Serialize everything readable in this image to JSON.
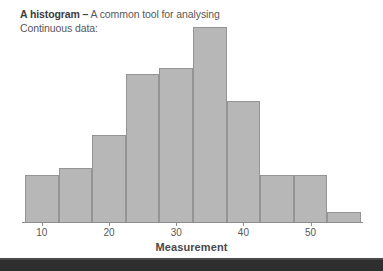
{
  "caption": {
    "lead": "A histogram –",
    "rest": " A common tool for analysing Continuous data:"
  },
  "chart_data": {
    "type": "bar",
    "title": "A histogram – A common tool for analysing Continuous data:",
    "xlabel": "Measurement",
    "ylabel": "",
    "grid": false,
    "legend": "none",
    "bin_width": 5,
    "xlim": [
      7.5,
      57.5
    ],
    "ylim": [
      0,
      31
    ],
    "tick_labels": [
      "10",
      "20",
      "30",
      "40",
      "50"
    ],
    "tick_values": [
      10,
      20,
      30,
      40,
      50
    ],
    "bin_starts": [
      7.5,
      12.5,
      17.5,
      22.5,
      27.5,
      32.5,
      37.5,
      42.5,
      47.5,
      52.5
    ],
    "bin_ends": [
      12.5,
      17.5,
      22.5,
      27.5,
      32.5,
      37.5,
      42.5,
      47.5,
      52.5,
      57.5
    ],
    "categories": [
      "7.5-12.5",
      "12.5-17.5",
      "17.5-22.5",
      "22.5-27.5",
      "27.5-32.5",
      "32.5-37.5",
      "37.5-42.5",
      "42.5-47.5",
      "47.5-52.5",
      "52.5-57.5"
    ],
    "values": [
      7,
      8,
      13,
      22,
      23,
      29,
      18,
      7,
      7,
      1.5
    ],
    "bar_color": "#b7b7b7",
    "bar_edge_color": "#949494",
    "axis_color": "#8d8d8d",
    "text_color": "#58585a"
  },
  "footer": {
    "band_color": "#2e2e2e"
  }
}
